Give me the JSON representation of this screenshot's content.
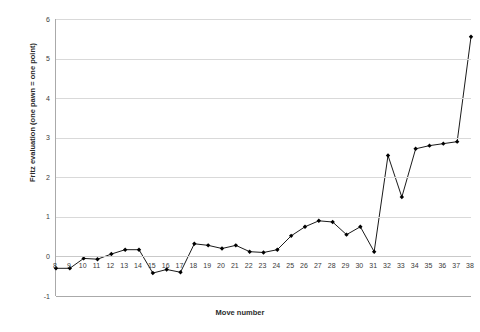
{
  "chart_data": {
    "type": "line",
    "title": "",
    "xlabel": "Move number",
    "ylabel": "Fritz evaluation (one pawn = one point)",
    "xlim": [
      8,
      38
    ],
    "ylim": [
      -1,
      6
    ],
    "ytick_labels": [
      "6",
      "5",
      "4",
      "3",
      "2",
      "1",
      "0",
      "-1"
    ],
    "yticks": [
      6,
      5,
      4,
      3,
      2,
      1,
      0,
      -1
    ],
    "xtick_labels": [
      "8",
      "9",
      "10",
      "11",
      "12",
      "13",
      "14",
      "15",
      "16",
      "17",
      "18",
      "19",
      "20",
      "21",
      "22",
      "23",
      "24",
      "25",
      "26",
      "27",
      "28",
      "29",
      "30",
      "31",
      "32",
      "33",
      "34",
      "35",
      "36",
      "37",
      "38"
    ],
    "grid": true,
    "legend": false,
    "marker": "diamond",
    "line_color": "#000000",
    "marker_color": "#000000",
    "grid_color": "#d9d9d9",
    "background": "#ffffff",
    "categories": [
      8,
      9,
      10,
      11,
      12,
      13,
      14,
      15,
      16,
      17,
      18,
      19,
      20,
      21,
      22,
      23,
      24,
      25,
      26,
      27,
      28,
      29,
      30,
      31,
      32,
      33,
      34,
      35,
      36,
      37,
      38
    ],
    "values": [
      -0.3,
      -0.3,
      -0.05,
      -0.07,
      0.06,
      0.17,
      0.17,
      -0.42,
      -0.33,
      -0.4,
      0.32,
      0.28,
      0.2,
      0.28,
      0.12,
      0.1,
      0.17,
      0.52,
      0.75,
      0.9,
      0.87,
      0.55,
      0.75,
      0.12,
      2.55,
      1.5,
      2.72,
      2.8,
      2.85,
      2.9,
      5.55
    ],
    "series": [
      {
        "name": "Fritz evaluation",
        "values": [
          -0.3,
          -0.3,
          -0.05,
          -0.07,
          0.06,
          0.17,
          0.17,
          -0.42,
          -0.33,
          -0.4,
          0.32,
          0.28,
          0.2,
          0.28,
          0.12,
          0.1,
          0.17,
          0.52,
          0.75,
          0.9,
          0.87,
          0.55,
          0.75,
          0.12,
          2.55,
          1.5,
          2.72,
          2.8,
          2.85,
          2.9,
          5.55
        ]
      }
    ]
  }
}
